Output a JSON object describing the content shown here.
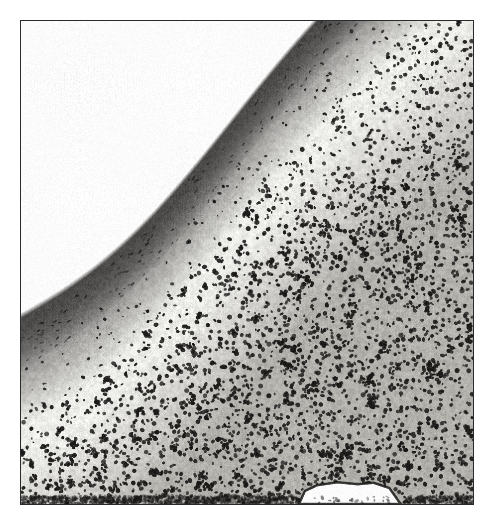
{
  "figure": {
    "kind": "histopathology-micrograph",
    "stain": "hematoxylin-eosin",
    "rendering": "grayscale",
    "caption": "",
    "width_px": 494,
    "height_px": 516,
    "background_color": "#ffffff"
  },
  "frame": {
    "name": "plate-frame",
    "x": 20,
    "y": 20,
    "width": 454,
    "height": 485,
    "border_color": "#2b2b2b",
    "border_width_px": 1.6,
    "fill_color": "#ffffff"
  },
  "image_content": {
    "orientation": "tissue surface runs from lower-left to upper-right across the top",
    "empty_corner": "top-left",
    "bottom_notch": "white gap along bottom edge between x=330 and x=400",
    "tones": {
      "paper_white": "#ffffff",
      "pale_zone": "#ededea",
      "mid_gray": "#b4b2ad",
      "dark_band": "#4c4a48",
      "nucleus_black": "#1c1b1a"
    },
    "zones": [
      {
        "name": "background-void",
        "description": "blank white field above and left of the tissue surface",
        "approx_area_fraction": 0.12,
        "mean_gray": 252
      },
      {
        "name": "surface-band",
        "description": "dark curved band of surface epithelium sweeping from lower-left to upper-right",
        "approx_area_fraction": 0.13,
        "mean_gray": 84
      },
      {
        "name": "pale-subepithelial-zone",
        "description": "light band beneath the dark surface band with sparse scattered nuclei",
        "approx_area_fraction": 0.17,
        "mean_gray": 226
      },
      {
        "name": "dense-infiltrate",
        "description": "dense field of small dark nuclei filling the lower two thirds",
        "approx_area_fraction": 0.58,
        "mean_gray": 150
      }
    ]
  },
  "render_params": {
    "seed": 20240517,
    "nucleus_count_dense": 5200,
    "nucleus_count_pale": 420,
    "nucleus_count_band": 900,
    "nucleus_radius_min": 1.6,
    "nucleus_radius_max": 3.6,
    "grain_amount": 26,
    "halftone_amount": 14
  }
}
